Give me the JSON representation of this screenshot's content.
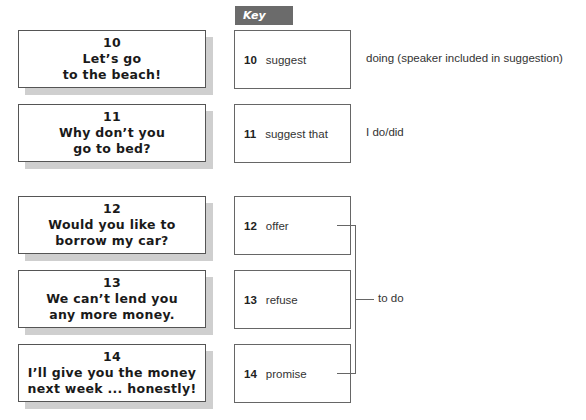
{
  "key": {
    "label": "Key"
  },
  "cards": [
    {
      "number": "10",
      "line1": "Let’s go",
      "line2": "to the beach!"
    },
    {
      "number": "11",
      "line1": "Why don’t you",
      "line2": "go to bed?"
    },
    {
      "number": "12",
      "line1": "Would you like to",
      "line2": "borrow my car?"
    },
    {
      "number": "13",
      "line1": "We can’t lend you",
      "line2": "any more money."
    },
    {
      "number": "14",
      "line1": "I’ll give you the money",
      "line2": "next week ... honestly!"
    }
  ],
  "key_items": [
    {
      "number": "10",
      "verb": "suggest"
    },
    {
      "number": "11",
      "verb": "suggest that"
    },
    {
      "number": "12",
      "verb": "offer"
    },
    {
      "number": "13",
      "verb": "refuse"
    },
    {
      "number": "14",
      "verb": "promise"
    }
  ],
  "notes": {
    "n10": "doing (speaker included in suggestion)",
    "n11": "I do/did",
    "group": "to do"
  }
}
